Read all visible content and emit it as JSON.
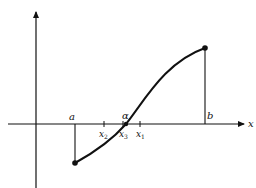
{
  "diagram": {
    "colors": {
      "ink": "#111111",
      "background": "#ffffff"
    },
    "axes": {
      "x_label": "x",
      "y_label": ""
    },
    "labels": {
      "a": "a",
      "b": "b",
      "alpha": "α",
      "x1": "x",
      "x1_sub": "1",
      "x2": "x",
      "x2_sub": "2",
      "x3": "x",
      "x3_sub": "3"
    },
    "points": [
      {
        "name": "f(a)",
        "x": 75,
        "y": 163
      },
      {
        "name": "alpha",
        "x": 126,
        "y": 124
      },
      {
        "name": "f(b)",
        "x": 205,
        "y": 48
      }
    ]
  }
}
